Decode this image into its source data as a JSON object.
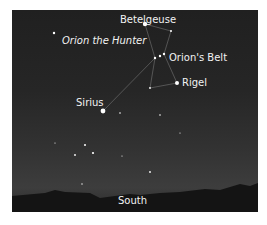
{
  "labels": {
    "betelgeuse": "Betelgeuse",
    "constellation": "Orion the Hunter",
    "belt": "Orion's Belt",
    "rigel": "Rigel",
    "sirius": "Sirius",
    "direction": "South"
  }
}
